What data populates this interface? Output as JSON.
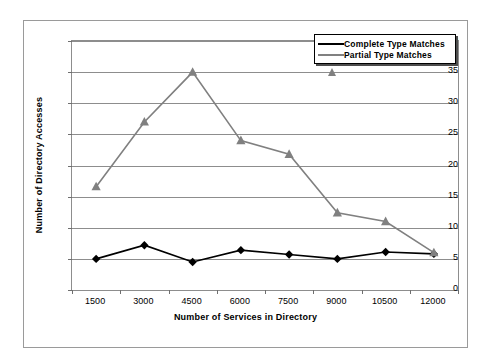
{
  "chart_data": {
    "type": "line",
    "title": "",
    "xlabel": "Number of Services in Directory",
    "ylabel": "Number of Directory Accesses",
    "categories": [
      "1500",
      "3000",
      "4500",
      "6000",
      "7500",
      "9000",
      "10500",
      "12000"
    ],
    "ylim": [
      0,
      40
    ],
    "yticks": [
      "0",
      "5",
      "10",
      "15",
      "20",
      "25",
      "30",
      "35",
      "40"
    ],
    "grid": true,
    "legend_position": "top-right",
    "series": [
      {
        "name": "Complete Type Matches",
        "color": "#000000",
        "marker": "diamond",
        "values": [
          5.0,
          7.2,
          4.5,
          6.4,
          5.7,
          5.0,
          6.1,
          5.8
        ]
      },
      {
        "name": "Partial Type Matches",
        "color": "#808080",
        "marker": "triangle",
        "values": [
          16.6,
          27.0,
          35.0,
          24.0,
          21.8,
          12.4,
          11.0,
          6.0
        ]
      }
    ]
  },
  "legend": {
    "items": [
      {
        "label": "Complete Type Matches"
      },
      {
        "label": "Partial Type Matches"
      }
    ]
  }
}
